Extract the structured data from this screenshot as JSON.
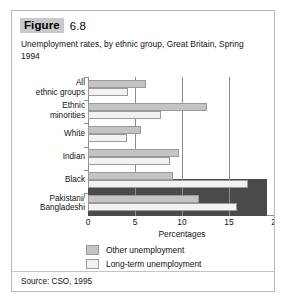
{
  "figure": {
    "tag": "Figure",
    "number": "6.8",
    "caption": "Unemployment rates, by ethnic group, Great Britain, Spring 1994",
    "source": "Source: CSO, 1995"
  },
  "legend": {
    "items": [
      {
        "label": "Other unemployment",
        "color": "#c4c4c4"
      },
      {
        "label": "Long-term unemployment",
        "color": "#f2f2f2"
      }
    ]
  },
  "axis": {
    "title": "Percentages",
    "ticks": [
      "0",
      "5",
      "10",
      "15",
      "20"
    ]
  },
  "chart_data": {
    "type": "bar",
    "orientation": "horizontal",
    "title": "Unemployment rates, by ethnic group, Great Britain, Spring 1994",
    "xlabel": "Percentages",
    "ylabel": "",
    "xlim": [
      0,
      20
    ],
    "xticks": [
      0,
      5,
      10,
      15,
      20
    ],
    "grid": true,
    "legend_position": "bottom",
    "source": "Source: CSO, 1995",
    "categories": [
      "All ethnic groups",
      "Ethnic minorities",
      "White",
      "Indian",
      "Black",
      "Pakistani/ Bangladeshi"
    ],
    "series": [
      {
        "name": "Other unemployment",
        "color": "#c4c4c4",
        "values": [
          6.2,
          12.7,
          5.6,
          9.7,
          9.0,
          11.8
        ]
      },
      {
        "name": "Long-term unemployment",
        "color": "#f2f2f2",
        "values": [
          4.3,
          7.8,
          4.1,
          8.7,
          17.0,
          15.8
        ]
      }
    ],
    "annotations": [
      {
        "type": "dark-band",
        "label": "shaded band",
        "x_end": 19.0,
        "covers": [
          "Black",
          "Pakistani/ Bangladeshi"
        ]
      }
    ]
  }
}
